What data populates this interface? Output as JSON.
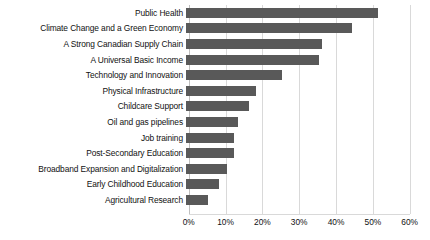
{
  "chart_data": {
    "type": "bar",
    "orientation": "horizontal",
    "title": "",
    "xlabel": "",
    "ylabel": "",
    "xlim": [
      0,
      60
    ],
    "xticks": [
      "0%",
      "10%",
      "20%",
      "30%",
      "40%",
      "50%",
      "60%"
    ],
    "xtick_values": [
      0,
      10,
      20,
      30,
      40,
      50,
      60
    ],
    "grid": true,
    "legend": false,
    "bar_color": "#595959",
    "gridline_color": "#d9d9d9",
    "categories": [
      "Public Health",
      "Climate Change and a Green Economy",
      "A Strong Canadian Supply Chain",
      "A Universal Basic Income",
      "Technology and Innovation",
      "Physical Infrastructure",
      "Childcare Support",
      "Oil and gas pipelines",
      "Job training",
      "Post-Secondary Education",
      "Broadband Expansion and Digitalization",
      "Early Childhood Education",
      "Agricultural Research"
    ],
    "values": [
      52,
      45,
      37,
      36,
      26,
      19,
      17,
      14,
      13,
      13,
      11,
      9,
      6
    ],
    "value_labels": [
      "52%",
      "45%",
      "37%",
      "36%",
      "26%",
      "19%",
      "17%",
      "14%",
      "13%",
      "13%",
      "11%",
      "9%",
      "6%"
    ]
  }
}
